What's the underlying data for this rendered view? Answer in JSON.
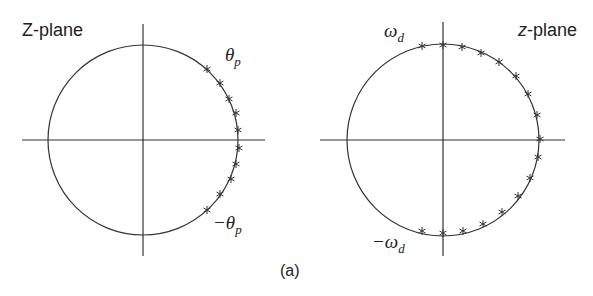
{
  "figure": {
    "caption": "(a)",
    "line_color": "#333333",
    "panels": [
      {
        "title": "Z-plane",
        "upper_label": "θ",
        "upper_sub": "p",
        "lower_label": "−θ",
        "lower_sub": "p",
        "center": [
          143,
          140
        ],
        "radius": 95,
        "h_axis": [
          22,
          265
        ],
        "v_axis": [
          24,
          256
        ],
        "markers": [
          [
            207,
            69
          ],
          [
            220,
            83
          ],
          [
            229,
            99
          ],
          [
            236,
            113
          ],
          [
            238,
            130
          ],
          [
            239,
            148
          ],
          [
            236,
            164
          ],
          [
            231,
            179
          ],
          [
            220,
            194
          ],
          [
            207,
            210
          ]
        ]
      },
      {
        "title_italic": "z",
        "title_rest": "-plane",
        "upper_label": "ω",
        "upper_sub": "d",
        "lower_label": "−ω",
        "lower_sub": "d",
        "center": [
          443,
          140
        ],
        "radius": 96,
        "h_axis": [
          320,
          565
        ],
        "v_axis": [
          22,
          256
        ],
        "markers": [
          [
            422,
            46
          ],
          [
            443,
            45
          ],
          [
            462,
            47
          ],
          [
            481,
            53
          ],
          [
            499,
            62
          ],
          [
            516,
            76
          ],
          [
            528,
            94
          ],
          [
            537,
            115
          ],
          [
            540,
            139
          ],
          [
            538,
            157
          ],
          [
            530,
            178
          ],
          [
            518,
            196
          ],
          [
            502,
            212
          ],
          [
            483,
            224
          ],
          [
            463,
            231
          ],
          [
            443,
            233
          ],
          [
            422,
            231
          ]
        ]
      }
    ]
  }
}
